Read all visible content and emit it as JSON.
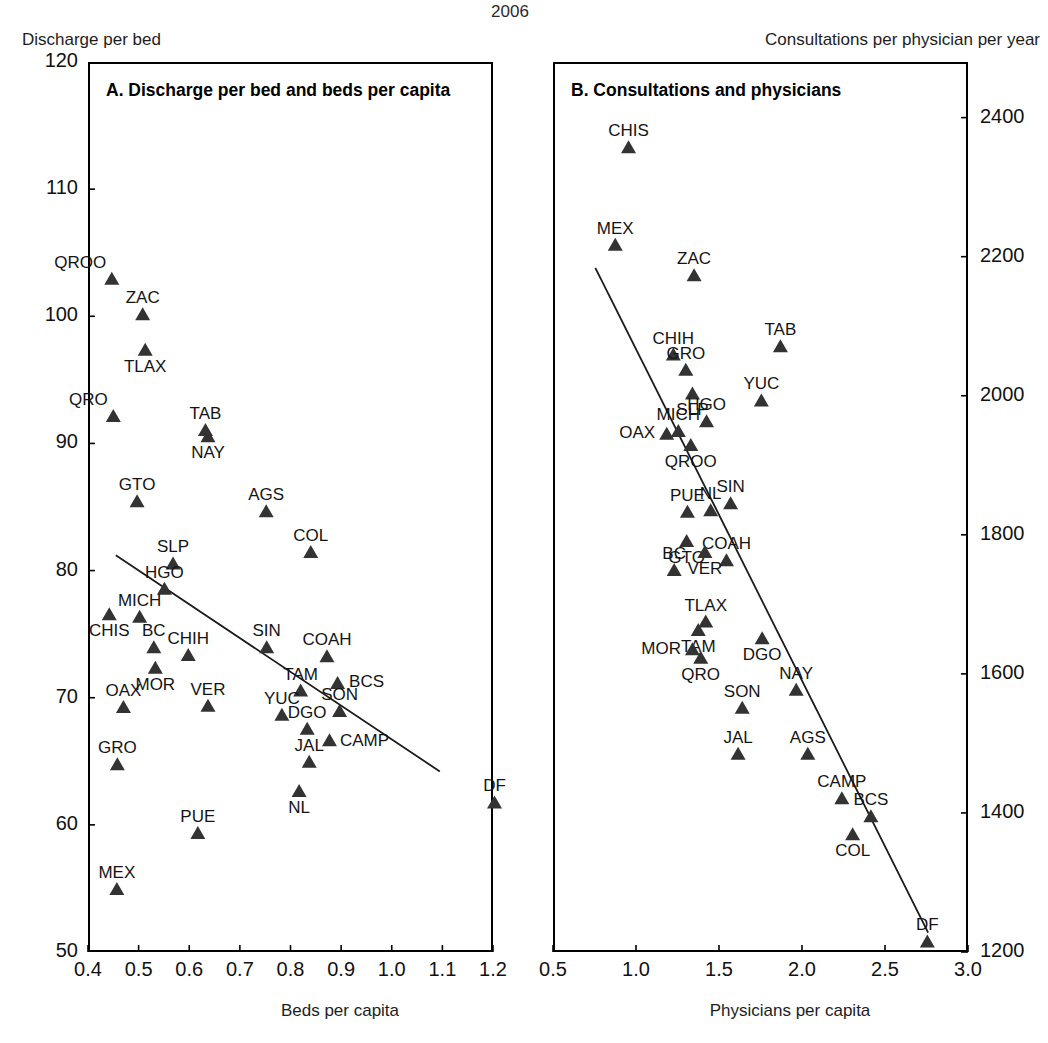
{
  "figure": {
    "year": "2006",
    "left_unit_caption": "Discharge per bed",
    "right_unit_caption": "Consultations per physician per year"
  },
  "panel_a": {
    "title": "A. Discharge per bed and beds per capita",
    "xlabel": "Beds per capita",
    "ylabel": "Discharge per bed",
    "xticks": [
      "0.4",
      "0.5",
      "0.6",
      "0.7",
      "0.8",
      "0.9",
      "1.0",
      "1.1",
      "1.2"
    ],
    "yticks": [
      "120",
      "110",
      "100",
      "90",
      "80",
      "70",
      "60",
      "50"
    ]
  },
  "panel_b": {
    "title": "B. Consultations and physicians",
    "xlabel": "Physicians per capita",
    "ylabel": "Consultations per physician per year",
    "xticks": [
      "0.5",
      "1.0",
      "1.5",
      "2.0",
      "2.5",
      "3.0"
    ],
    "yticks": [
      "2400",
      "2200",
      "2000",
      "1800",
      "1600",
      "1400",
      "1200"
    ]
  },
  "chart_data": [
    {
      "type": "scatter",
      "panel": "A",
      "title": "A. Discharge per bed and beds per capita",
      "xlabel": "Beds per capita",
      "ylabel": "Discharge per bed",
      "xlim": [
        0.4,
        1.2
      ],
      "ylim": [
        50,
        120
      ],
      "xticks": [
        0.4,
        0.5,
        0.6,
        0.7,
        0.8,
        0.9,
        1.0,
        1.1,
        1.2
      ],
      "yticks": [
        50,
        60,
        70,
        80,
        90,
        100,
        110,
        120
      ],
      "grid": false,
      "legend": "none",
      "marker": "filled-triangle",
      "trendline": {
        "x": [
          0.455,
          1.095
        ],
        "y": [
          81.2,
          64.2
        ]
      },
      "points": [
        {
          "label": "QROO",
          "x": 0.447,
          "y": 103.0,
          "label_pos": "left-top"
        },
        {
          "label": "ZAC",
          "x": 0.508,
          "y": 100.2,
          "label_pos": "top"
        },
        {
          "label": "TLAX",
          "x": 0.513,
          "y": 97.4,
          "label_pos": "bottom"
        },
        {
          "label": "QRO",
          "x": 0.45,
          "y": 92.2,
          "label_pos": "left-top"
        },
        {
          "label": "TAB",
          "x": 0.632,
          "y": 91.1,
          "label_pos": "top"
        },
        {
          "label": "NAY",
          "x": 0.637,
          "y": 90.6,
          "label_pos": "bottom"
        },
        {
          "label": "GTO",
          "x": 0.497,
          "y": 85.5,
          "label_pos": "top"
        },
        {
          "label": "AGS",
          "x": 0.752,
          "y": 84.7,
          "label_pos": "top"
        },
        {
          "label": "COL",
          "x": 0.84,
          "y": 81.5,
          "label_pos": "top"
        },
        {
          "label": "SLP",
          "x": 0.568,
          "y": 80.6,
          "label_pos": "top"
        },
        {
          "label": "HGO",
          "x": 0.551,
          "y": 78.6,
          "label_pos": "top"
        },
        {
          "label": "MICH",
          "x": 0.502,
          "y": 76.4,
          "label_pos": "top"
        },
        {
          "label": "CHIS",
          "x": 0.442,
          "y": 76.6,
          "label_pos": "bottom"
        },
        {
          "label": "BC",
          "x": 0.53,
          "y": 74.0,
          "label_pos": "top"
        },
        {
          "label": "CHIH",
          "x": 0.598,
          "y": 73.4,
          "label_pos": "top"
        },
        {
          "label": "SIN",
          "x": 0.753,
          "y": 74.0,
          "label_pos": "top"
        },
        {
          "label": "MOR",
          "x": 0.533,
          "y": 72.4,
          "label_pos": "bottom"
        },
        {
          "label": "COAH",
          "x": 0.872,
          "y": 73.3,
          "label_pos": "top"
        },
        {
          "label": "BCS",
          "x": 0.893,
          "y": 71.2,
          "label_pos": "right"
        },
        {
          "label": "TAM",
          "x": 0.82,
          "y": 70.6,
          "label_pos": "top"
        },
        {
          "label": "OAX",
          "x": 0.47,
          "y": 69.3,
          "label_pos": "top"
        },
        {
          "label": "VER",
          "x": 0.637,
          "y": 69.4,
          "label_pos": "top"
        },
        {
          "label": "YUC",
          "x": 0.783,
          "y": 68.7,
          "label_pos": "top"
        },
        {
          "label": "SON",
          "x": 0.897,
          "y": 69.0,
          "label_pos": "top"
        },
        {
          "label": "DGO",
          "x": 0.833,
          "y": 67.6,
          "label_pos": "top"
        },
        {
          "label": "CAMP",
          "x": 0.877,
          "y": 66.7,
          "label_pos": "bottom-right"
        },
        {
          "label": "JAL",
          "x": 0.837,
          "y": 65.0,
          "label_pos": "top"
        },
        {
          "label": "GRO",
          "x": 0.458,
          "y": 64.8,
          "label_pos": "top"
        },
        {
          "label": "NL",
          "x": 0.817,
          "y": 62.7,
          "label_pos": "bottom"
        },
        {
          "label": "DF",
          "x": 1.203,
          "y": 61.8,
          "label_pos": "top"
        },
        {
          "label": "PUE",
          "x": 0.617,
          "y": 59.4,
          "label_pos": "top"
        },
        {
          "label": "MEX",
          "x": 0.457,
          "y": 55.0,
          "label_pos": "top"
        }
      ]
    },
    {
      "type": "scatter",
      "panel": "B",
      "title": "B. Consultations and physicians",
      "xlabel": "Physicians per capita",
      "ylabel": "Consultations per physician per year",
      "xlim": [
        0.5,
        3.0
      ],
      "ylim": [
        1200,
        2480
      ],
      "xticks": [
        0.5,
        1.0,
        1.5,
        2.0,
        2.5,
        3.0
      ],
      "yticks": [
        1200,
        1400,
        1600,
        1800,
        2000,
        2200,
        2400
      ],
      "grid": false,
      "legend": "none",
      "marker": "filled-triangle",
      "trendline": {
        "x": [
          0.755,
          2.76
        ],
        "y": [
          2184,
          1228
        ]
      },
      "points": [
        {
          "label": "CHIS",
          "x": 0.955,
          "y": 2358,
          "label_pos": "top"
        },
        {
          "label": "MEX",
          "x": 0.875,
          "y": 2218,
          "label_pos": "top"
        },
        {
          "label": "ZAC",
          "x": 1.35,
          "y": 2174,
          "label_pos": "top"
        },
        {
          "label": "TAB",
          "x": 1.87,
          "y": 2072,
          "label_pos": "top"
        },
        {
          "label": "CHIH",
          "x": 1.225,
          "y": 2060,
          "label_pos": "top"
        },
        {
          "label": "GRO",
          "x": 1.3,
          "y": 2038,
          "label_pos": "top"
        },
        {
          "label": "SLP",
          "x": 1.34,
          "y": 2004,
          "label_pos": "bottom"
        },
        {
          "label": "YUC",
          "x": 1.755,
          "y": 1994,
          "label_pos": "top"
        },
        {
          "label": "HGO",
          "x": 1.425,
          "y": 1964,
          "label_pos": "top"
        },
        {
          "label": "MICH",
          "x": 1.255,
          "y": 1950,
          "label_pos": "top"
        },
        {
          "label": "OAX",
          "x": 1.185,
          "y": 1946,
          "label_pos": "left"
        },
        {
          "label": "QROO",
          "x": 1.33,
          "y": 1930,
          "label_pos": "bottom"
        },
        {
          "label": "SIN",
          "x": 1.57,
          "y": 1846,
          "label_pos": "top"
        },
        {
          "label": "NL",
          "x": 1.45,
          "y": 1836,
          "label_pos": "top"
        },
        {
          "label": "PUE",
          "x": 1.31,
          "y": 1834,
          "label_pos": "top"
        },
        {
          "label": "GTO",
          "x": 1.305,
          "y": 1792,
          "label_pos": "bottom"
        },
        {
          "label": "COAH",
          "x": 1.545,
          "y": 1764,
          "label_pos": "top"
        },
        {
          "label": "VER",
          "x": 1.415,
          "y": 1776,
          "label_pos": "bottom"
        },
        {
          "label": "BC",
          "x": 1.23,
          "y": 1750,
          "label_pos": "top"
        },
        {
          "label": "TLAX",
          "x": 1.42,
          "y": 1676,
          "label_pos": "top"
        },
        {
          "label": "TAM",
          "x": 1.375,
          "y": 1664,
          "label_pos": "bottom"
        },
        {
          "label": "DGO",
          "x": 1.76,
          "y": 1652,
          "label_pos": "bottom"
        },
        {
          "label": "MOR",
          "x": 1.34,
          "y": 1636,
          "label_pos": "left"
        },
        {
          "label": "QRO",
          "x": 1.39,
          "y": 1624,
          "label_pos": "bottom"
        },
        {
          "label": "NAY",
          "x": 1.965,
          "y": 1578,
          "label_pos": "top"
        },
        {
          "label": "SON",
          "x": 1.64,
          "y": 1552,
          "label_pos": "top"
        },
        {
          "label": "JAL",
          "x": 1.615,
          "y": 1486,
          "label_pos": "top"
        },
        {
          "label": "AGS",
          "x": 2.035,
          "y": 1486,
          "label_pos": "top"
        },
        {
          "label": "CAMP",
          "x": 2.24,
          "y": 1422,
          "label_pos": "top"
        },
        {
          "label": "BCS",
          "x": 2.415,
          "y": 1396,
          "label_pos": "top"
        },
        {
          "label": "COL",
          "x": 2.305,
          "y": 1370,
          "label_pos": "bottom"
        },
        {
          "label": "DF",
          "x": 2.755,
          "y": 1216,
          "label_pos": "top"
        }
      ]
    }
  ]
}
